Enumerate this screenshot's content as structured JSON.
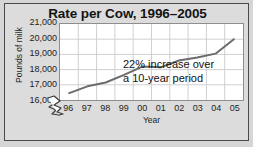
{
  "chart_data": {
    "type": "line",
    "title": "Rate per Cow, 1996–2005",
    "xlabel": "Year",
    "ylabel": "Pounds of milk",
    "categories": [
      "96",
      "97",
      "98",
      "99",
      "00",
      "01",
      "02",
      "03",
      "04",
      "05"
    ],
    "x_tick_labels": [
      "96",
      "97",
      "98",
      "99",
      "00",
      "01",
      "02",
      "03",
      "04",
      "05"
    ],
    "y_tick_labels": [
      "21,000",
      "20,000",
      "19,000",
      "18,000",
      "17,000",
      "16,000"
    ],
    "y_tick_values": [
      21000,
      20000,
      19000,
      18000,
      17000,
      16000
    ],
    "values": [
      16450,
      16900,
      17150,
      17650,
      18200,
      18150,
      18600,
      18800,
      19050,
      20000
    ],
    "ylim": [
      16000,
      21000
    ],
    "grid": true,
    "legend": false,
    "axis_break": true,
    "series_color": "#6b6b6b",
    "grid_color": "#cfcfcf",
    "annotations": [
      {
        "line1": "22% increase over",
        "line2": "a 10-year period"
      }
    ]
  },
  "annotation": {
    "line1": "22% increase over",
    "line2": "a 10-year period"
  },
  "colors": {
    "background": "#d6d6d6",
    "frame_border": "#4a4a4a",
    "plot_background": "#ffffff",
    "line": "#6b6b6b",
    "grid": "#cfcfcf",
    "text": "#1c1c1c"
  }
}
